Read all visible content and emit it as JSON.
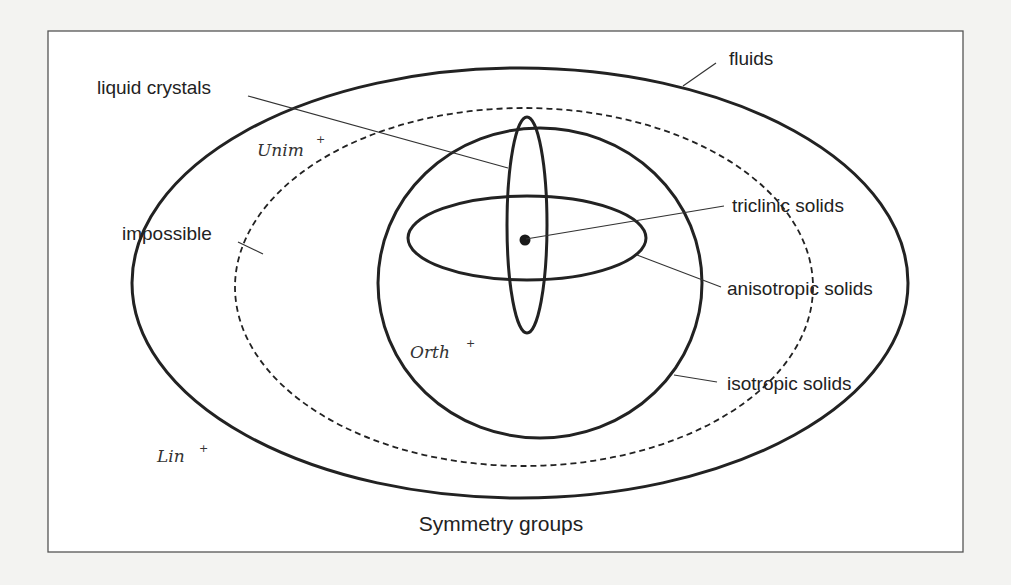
{
  "diagram": {
    "title": "Symmetry groups",
    "regions": [
      {
        "id": "fluids",
        "label": "fluids",
        "shape": "ellipse",
        "style": "solid"
      },
      {
        "id": "impossible",
        "label": "impossible",
        "shape": "ellipse",
        "style": "dashed"
      },
      {
        "id": "isotropic",
        "label": "isotropic solids",
        "shape": "ellipse",
        "style": "solid"
      },
      {
        "id": "anisotropic",
        "label": "anisotropic solids",
        "shape": "ellipse",
        "style": "solid"
      },
      {
        "id": "liquid_crystals",
        "label": "liquid crystals",
        "shape": "ellipse",
        "style": "solid"
      },
      {
        "id": "triclinic",
        "label": "triclinic solids",
        "shape": "point",
        "style": "filled"
      }
    ],
    "group_labels": {
      "unim": {
        "name": "Unim",
        "sup": "+"
      },
      "orth": {
        "name": "Orth",
        "sup": "+"
      },
      "lin": {
        "name": "Lin",
        "sup": "+"
      }
    },
    "labels": {
      "liquid_crystals": "liquid crystals",
      "fluids": "fluids",
      "impossible": "impossible",
      "triclinic": "triclinic solids",
      "anisotropic": "anisotropic solids",
      "isotropic": "isotropic solids"
    },
    "colors": {
      "stroke": "#222222",
      "frame": "#555555",
      "background": "#ffffff",
      "page": "#f3f3f1"
    }
  }
}
